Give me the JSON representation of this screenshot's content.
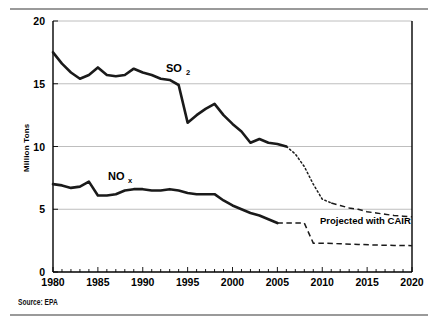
{
  "figure": {
    "source_note": "Source: EPA",
    "background_color": "#ffffff",
    "line_color": "#1a1a1a",
    "grid_color": "#b7b7b7"
  },
  "chart_data": {
    "type": "line",
    "title": "",
    "xlabel": "",
    "ylabel": "Million Tons",
    "xlim": [
      1980,
      2020
    ],
    "ylim": [
      0,
      20
    ],
    "grid": "horizontal",
    "legend": "inline-labels",
    "xticks": [
      "1980",
      "1985",
      "1990",
      "1995",
      "2000",
      "2005",
      "2010",
      "2015",
      "2020"
    ],
    "yticks": [
      "0",
      "5",
      "10",
      "15",
      "20"
    ],
    "minor_xtick_interval": 1,
    "annotations": [
      {
        "name": "so2-label",
        "text": "SO",
        "subscript": "2",
        "x": 1993.0,
        "y": 16.3
      },
      {
        "name": "nox-label",
        "text": "NO",
        "subscript": "x",
        "x": 1987.5,
        "y": 8.1
      },
      {
        "name": "projected-label",
        "text": "Projected with CAIR",
        "x": 2011.5,
        "y": 3.8
      }
    ],
    "series": [
      {
        "name": "SO2",
        "style": "solid",
        "label": "SO2",
        "x": [
          1980,
          1981,
          1982,
          1983,
          1984,
          1985,
          1986,
          1987,
          1988,
          1989,
          1990,
          1991,
          1992,
          1993,
          1994,
          1995,
          1996,
          1997,
          1998,
          1999,
          2000,
          2001,
          2002,
          2003,
          2004,
          2005,
          2006
        ],
        "values": [
          17.5,
          16.6,
          15.9,
          15.4,
          15.7,
          16.3,
          15.7,
          15.6,
          15.7,
          16.2,
          15.9,
          15.7,
          15.4,
          15.3,
          14.9,
          11.9,
          12.5,
          13.0,
          13.4,
          12.5,
          11.8,
          11.2,
          10.3,
          10.6,
          10.3,
          10.2,
          10.0
        ]
      },
      {
        "name": "SO2 projected with CAIR",
        "style": "dotted-dashed",
        "label": "Projected with CAIR",
        "x": [
          2006,
          2007,
          2008,
          2009,
          2010,
          2011,
          2012,
          2013,
          2014,
          2015,
          2016,
          2017,
          2018,
          2019,
          2020
        ],
        "values": [
          10.0,
          9.4,
          8.4,
          7.0,
          5.8,
          5.5,
          5.3,
          5.1,
          5.0,
          4.8,
          4.7,
          4.6,
          4.5,
          4.45,
          4.4
        ]
      },
      {
        "name": "NOx",
        "style": "solid",
        "label": "NOx",
        "x": [
          1980,
          1981,
          1982,
          1983,
          1984,
          1985,
          1986,
          1987,
          1988,
          1989,
          1990,
          1991,
          1992,
          1993,
          1994,
          1995,
          1996,
          1997,
          1998,
          1999,
          2000,
          2001,
          2002,
          2003,
          2004,
          2005
        ],
        "values": [
          7.0,
          6.9,
          6.7,
          6.8,
          7.2,
          6.1,
          6.1,
          6.2,
          6.5,
          6.6,
          6.6,
          6.5,
          6.5,
          6.6,
          6.5,
          6.3,
          6.2,
          6.2,
          6.2,
          5.7,
          5.3,
          5.0,
          4.7,
          4.5,
          4.2,
          3.9
        ]
      },
      {
        "name": "NOx projected with CAIR",
        "style": "dashed",
        "label": "Projected with CAIR",
        "x": [
          2005,
          2006,
          2007,
          2008,
          2009,
          2010,
          2012,
          2014,
          2016,
          2018,
          2020
        ],
        "values": [
          3.9,
          3.9,
          3.9,
          3.9,
          2.3,
          2.3,
          2.25,
          2.2,
          2.15,
          2.12,
          2.1
        ]
      }
    ]
  }
}
